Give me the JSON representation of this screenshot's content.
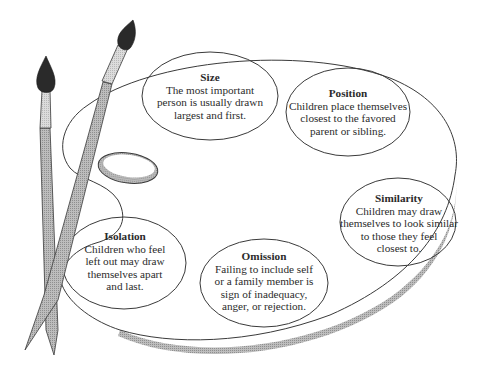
{
  "diagram": {
    "type": "artist-palette-with-paintbrushes",
    "colors": {
      "outline": "#3a3a3a",
      "palette_fill": "#ffffff",
      "palette_edge_shadow": "#a9a9a9",
      "brush_handle": "#b5b5b5",
      "brush_ferrule": "#d6d6d6",
      "brush_tip": "#2a2a2a",
      "text": "#2b2b2b"
    },
    "bubbles": [
      {
        "id": "size",
        "title": "Size",
        "body_lines": [
          "The most important",
          "person is usually drawn",
          "largest and first."
        ]
      },
      {
        "id": "position",
        "title": "Position",
        "body_lines": [
          "Children place themselves",
          "closest to the favored",
          "parent or sibling."
        ]
      },
      {
        "id": "similarity",
        "title": "Similarity",
        "body_lines": [
          "Children may draw",
          "themselves to look similar",
          "to those they feel",
          "closest to."
        ]
      },
      {
        "id": "isolation",
        "title": "Isolation",
        "body_lines": [
          "Children who feel",
          "left out may draw",
          "themselves apart",
          "and last."
        ]
      },
      {
        "id": "omission",
        "title": "Omission",
        "body_lines": [
          "Failing to include self",
          "or a family member is",
          "sign of inadequacy,",
          "anger, or rejection."
        ]
      }
    ]
  }
}
